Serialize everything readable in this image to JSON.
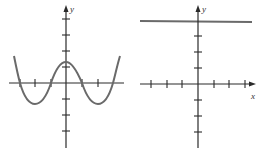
{
  "figures": [
    {
      "id": "left-graph",
      "description": "Graph of a quartic-like curve with four x-intercepts and a local maximum at the y-axis",
      "y_axis_label": "y",
      "x_ticks": 7,
      "y_ticks_above": 4,
      "y_ticks_below": 3,
      "curve_color": "#6a6a6a"
    },
    {
      "id": "right-graph",
      "description": "Graph of a horizontal line above the x-axis",
      "y_axis_label": "y",
      "x_axis_label": "x",
      "x_ticks": 6,
      "y_ticks_above": 3,
      "y_ticks_below": 3,
      "line_color": "#6a6a6a"
    }
  ],
  "labels": {
    "left_y": "y",
    "right_y": "y",
    "right_x": "x"
  }
}
